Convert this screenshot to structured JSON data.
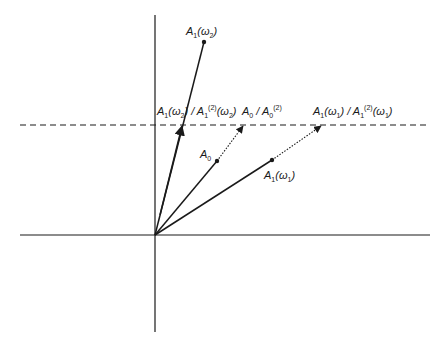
{
  "diagram": {
    "type": "phasor-vector-diagram",
    "colors": {
      "stroke": "#1a1a1a",
      "background": "#ffffff"
    },
    "axes": {
      "origin": [
        155,
        235
      ],
      "horizontal": {
        "x1": 20,
        "x2": 430,
        "y": 235
      },
      "vertical": {
        "x": 155,
        "y1": 15,
        "y2": 332
      }
    },
    "dashed_line": {
      "x1": 20,
      "x2": 430,
      "y": 125
    },
    "vectors": [
      {
        "name": "A1(omega2)",
        "from": [
          155,
          235
        ],
        "to": [
          204,
          42
        ],
        "style": "solid",
        "dot_at_end": true
      },
      {
        "name": "A1(omega2)/A1(2)(omega2)",
        "from": [
          155,
          235
        ],
        "to": [
          182,
          125
        ],
        "style": "solid",
        "arrow": true
      },
      {
        "name": "A0",
        "from": [
          155,
          235
        ],
        "to": [
          217,
          161
        ],
        "style": "solid",
        "dot_at_end": true
      },
      {
        "name": "A0/A0(2)",
        "from": [
          217,
          161
        ],
        "to": [
          244,
          125
        ],
        "style": "dotted",
        "arrow": true
      },
      {
        "name": "A1(omega1)",
        "from": [
          155,
          235
        ],
        "to": [
          272,
          160
        ],
        "style": "solid",
        "dot_at_end": true
      },
      {
        "name": "A1(omega1)/A1(2)(omega1)",
        "from": [
          272,
          160
        ],
        "to": [
          322,
          125
        ],
        "style": "dotted",
        "arrow": true
      }
    ],
    "labels": {
      "a1_omega2": {
        "A": "A",
        "sub1": "1",
        "open": "(",
        "omega": "ω",
        "sub2": "2",
        "close": ")"
      },
      "ratio_omega2": {
        "A": "A",
        "sub1": "1",
        "open": "(",
        "omega": "ω",
        "sub2": "2",
        "mid": ") / ",
        "A2": "A",
        "sub3": "1",
        "sup": "(2)",
        "open2": "(",
        "omega2": "ω",
        "sub4": "2",
        "close": ")"
      },
      "ratio_a0": {
        "A": "A",
        "sub1": "0",
        "mid": " / ",
        "A2": "A",
        "sub2": "0",
        "sup": "(2)"
      },
      "ratio_omega1": {
        "A": "A",
        "sub1": "1",
        "open": "(",
        "omega": "ω",
        "sub2": "1",
        "mid": ") / ",
        "A2": "A",
        "sub3": "1",
        "sup": "(2)",
        "open2": "(",
        "omega2": "ω",
        "sub4": "1",
        "close": ")"
      },
      "a0": {
        "A": "A",
        "sub1": "0"
      },
      "a1_omega1": {
        "A": "A",
        "sub1": "1",
        "open": "(",
        "omega": "ω",
        "sub2": "1",
        "close": ")"
      }
    }
  }
}
